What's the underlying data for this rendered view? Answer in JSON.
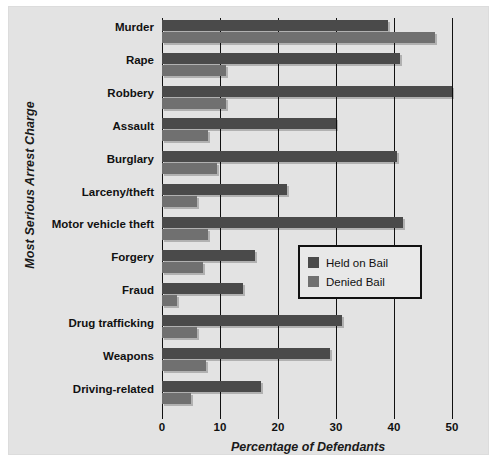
{
  "chart_data": {
    "type": "bar",
    "orientation": "horizontal",
    "title": "",
    "xlabel": "Percentage of Defendants",
    "ylabel": "Most Serious Arrest Charge",
    "xlim": [
      0,
      50
    ],
    "xticks": [
      0,
      10,
      20,
      30,
      40,
      50
    ],
    "xticklabels": [
      "0",
      "10",
      "20",
      "30",
      "40",
      "50"
    ],
    "grid": "vertical",
    "legend_position": "center-right-inside",
    "categories": [
      "Murder",
      "Rape",
      "Robbery",
      "Assault",
      "Burglary",
      "Larceny/theft",
      "Motor vehicle theft",
      "Forgery",
      "Fraud",
      "Drug trafficking",
      "Weapons",
      "Driving-related"
    ],
    "series": [
      {
        "name": "Held on Bail",
        "color": "#4a4a4a",
        "values": [
          39,
          41,
          50,
          30,
          40.5,
          21.5,
          41.5,
          16,
          14,
          31,
          29,
          17
        ]
      },
      {
        "name": "Denied Bail",
        "color": "#707070",
        "values": [
          47,
          11,
          11,
          8,
          9.5,
          6,
          8,
          7,
          2.5,
          6,
          7.5,
          5
        ]
      }
    ]
  },
  "legend": {
    "items": [
      {
        "label": "Held on Bail",
        "swatch": "held"
      },
      {
        "label": "Denied Bail",
        "swatch": "denied"
      }
    ]
  }
}
